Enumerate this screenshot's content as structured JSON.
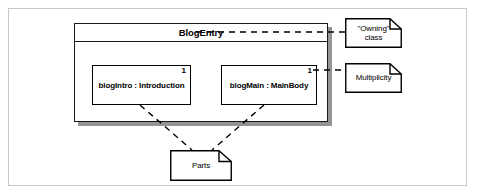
{
  "diagram": {
    "frame": {
      "visible": true
    },
    "composite_class": {
      "name": "BlogEntry",
      "parts": [
        {
          "id": "blogIntro",
          "label": "blogIntro : Introduction",
          "multiplicity": "1"
        },
        {
          "id": "blogMain",
          "label": "blogMain : MainBody",
          "multiplicity": "1"
        }
      ]
    },
    "notes": [
      {
        "id": "owning",
        "text": "\"Owning\"\nclass",
        "anchor": "composite-class-name"
      },
      {
        "id": "multiplicity",
        "text": "Multiplicity",
        "anchor": "blogMain-multiplicity"
      },
      {
        "id": "parts",
        "text": "Parts",
        "anchor": "part-boxes"
      }
    ],
    "colors": {
      "background": "#ffffff",
      "line": "#000000",
      "frame": "#c8c8c8",
      "shadow": "#3c3c3c"
    }
  }
}
